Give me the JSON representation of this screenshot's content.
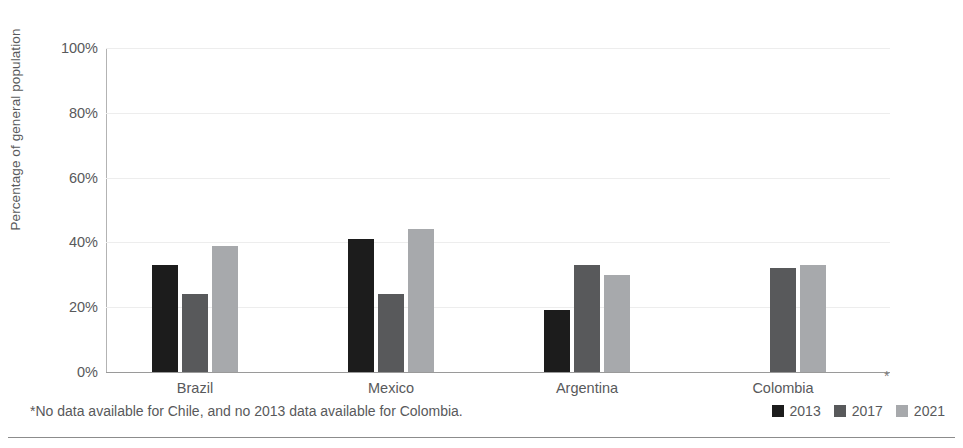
{
  "chart_data": {
    "type": "bar",
    "title": "",
    "subtitle": "",
    "xlabel": "",
    "ylabel": "Percentage of general population",
    "ylim": [
      0,
      100
    ],
    "ytick_labels": [
      "0%",
      "20%",
      "40%",
      "60%",
      "80%",
      "100%"
    ],
    "ytick_values": [
      0,
      20,
      40,
      60,
      80,
      100
    ],
    "ytick_suffix": "%",
    "grid": true,
    "grid_axis": "y",
    "legend_position": "bottom-right",
    "categories": [
      "Brazil",
      "Mexico",
      "Argentina",
      "Colombia"
    ],
    "series": [
      {
        "name": "2013",
        "color": "#1c1c1c",
        "values": [
          33,
          41,
          19,
          null
        ]
      },
      {
        "name": "2017",
        "color": "#58595b",
        "values": [
          24,
          24,
          33,
          32
        ]
      },
      {
        "name": "2021",
        "color": "#a7a9ac",
        "values": [
          39,
          44,
          30,
          33
        ]
      }
    ],
    "annotations": [
      {
        "name": "axis-asterisk",
        "text": "*"
      }
    ],
    "footnote": "*No data available for Chile, and no 2013 data available for Colombia."
  },
  "legend": {
    "items": [
      {
        "label": "2013",
        "color": "#1c1c1c"
      },
      {
        "label": "2017",
        "color": "#58595b"
      },
      {
        "label": "2021",
        "color": "#a7a9ac"
      }
    ]
  },
  "axis": {
    "y_title": "Percentage of general population",
    "asterisk": "*"
  },
  "footnote": {
    "text": "*No data available for Chile, and no 2013 data available for Colombia."
  },
  "colors": {
    "series_2013": "#1c1c1c",
    "series_2017": "#58595b",
    "series_2021": "#a7a9ac",
    "gridline": "#ededed",
    "axis": "#9a9a9a",
    "text": "#58595b",
    "background": "#ffffff"
  }
}
